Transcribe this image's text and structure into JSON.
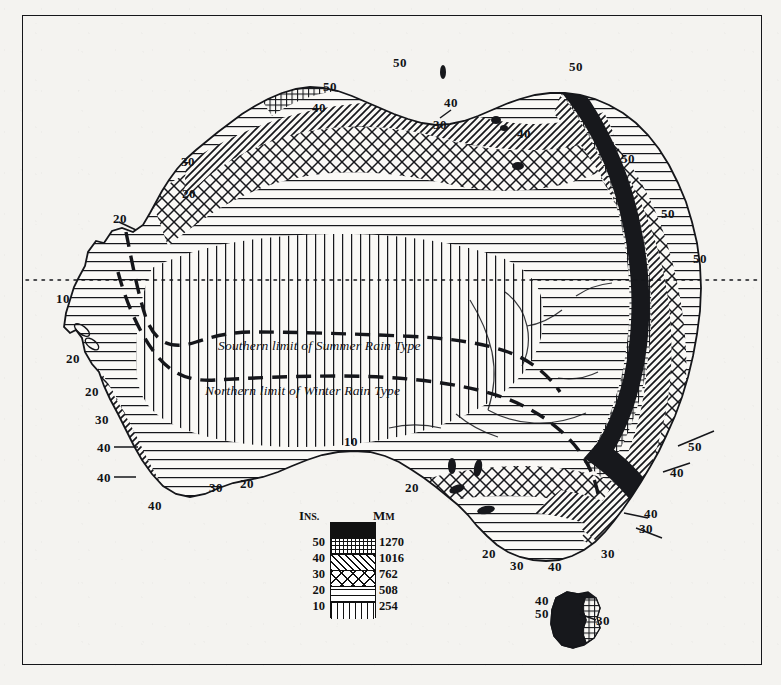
{
  "map": {
    "subject": "Australia",
    "theme": "Mean annual rainfall",
    "frame": {
      "x": 22,
      "y": 15,
      "width": 740,
      "height": 650
    },
    "reference_lines": [
      {
        "name": "tropic-of-capricorn",
        "style": "fine-dotted",
        "label": ""
      }
    ],
    "annotations": [
      {
        "id": "summer-rain-limit",
        "text": "Southern limit of Summer Rain Type",
        "x": 218,
        "y": 346,
        "style": "italic"
      },
      {
        "id": "winter-rain-limit",
        "text": "Northern limit of Winter Rain Type",
        "x": 205,
        "y": 391,
        "style": "italic"
      }
    ],
    "isohyet_labels": [
      {
        "value": "50",
        "x": 400,
        "y": 62
      },
      {
        "value": "50",
        "x": 330,
        "y": 86
      },
      {
        "value": "40",
        "x": 319,
        "y": 107
      },
      {
        "value": "40",
        "x": 451,
        "y": 102
      },
      {
        "value": "30",
        "x": 440,
        "y": 124
      },
      {
        "value": "40",
        "x": 524,
        "y": 133
      },
      {
        "value": "50",
        "x": 576,
        "y": 66
      },
      {
        "value": "50",
        "x": 628,
        "y": 158
      },
      {
        "value": "50",
        "x": 668,
        "y": 213
      },
      {
        "value": "50",
        "x": 700,
        "y": 258
      },
      {
        "value": "30",
        "x": 188,
        "y": 161
      },
      {
        "value": "20",
        "x": 189,
        "y": 193
      },
      {
        "value": "20",
        "x": 120,
        "y": 218
      },
      {
        "value": "10",
        "x": 63,
        "y": 298
      },
      {
        "value": "20",
        "x": 73,
        "y": 358
      },
      {
        "value": "20",
        "x": 92,
        "y": 391
      },
      {
        "value": "30",
        "x": 102,
        "y": 419
      },
      {
        "value": "40",
        "x": 104,
        "y": 447
      },
      {
        "value": "40",
        "x": 104,
        "y": 477
      },
      {
        "value": "40",
        "x": 155,
        "y": 505
      },
      {
        "value": "30",
        "x": 216,
        "y": 487
      },
      {
        "value": "20",
        "x": 247,
        "y": 483
      },
      {
        "value": "10",
        "x": 351,
        "y": 441
      },
      {
        "value": "20",
        "x": 412,
        "y": 487
      },
      {
        "value": "20",
        "x": 489,
        "y": 553
      },
      {
        "value": "30",
        "x": 517,
        "y": 565
      },
      {
        "value": "40",
        "x": 555,
        "y": 566
      },
      {
        "value": "30",
        "x": 608,
        "y": 553
      },
      {
        "value": "30",
        "x": 646,
        "y": 528
      },
      {
        "value": "40",
        "x": 651,
        "y": 513
      },
      {
        "value": "40",
        "x": 677,
        "y": 472
      },
      {
        "value": "50",
        "x": 695,
        "y": 446
      },
      {
        "value": "40",
        "x": 542,
        "y": 600
      },
      {
        "value": "50",
        "x": 542,
        "y": 613
      },
      {
        "value": "30",
        "x": 603,
        "y": 620
      }
    ]
  },
  "legend": {
    "name": "rainfall-legend",
    "header_left": "I",
    "header_left_small": "NS.",
    "header_right": "M",
    "header_right_small": "M",
    "bands": [
      {
        "pattern": "solid-black",
        "ins": "",
        "mm": ""
      },
      {
        "pattern": "fine-grid",
        "ins": "50",
        "mm": "1270"
      },
      {
        "pattern": "diagonal-hatch",
        "ins": "40",
        "mm": "1016"
      },
      {
        "pattern": "cross-hatch",
        "ins": "30",
        "mm": "762"
      },
      {
        "pattern": "horizontal-lines",
        "ins": "20",
        "mm": "508"
      },
      {
        "pattern": "vertical-lines",
        "ins": "10",
        "mm": "254"
      }
    ]
  },
  "chart_data": {
    "type": "map",
    "units_primary": "inches",
    "units_secondary": "millimetres",
    "categories": [
      "over 50",
      "40-50",
      "30-40",
      "20-30",
      "10-20",
      "under 10"
    ],
    "class_breaks_inches": [
      50,
      40,
      30,
      20,
      10
    ],
    "class_breaks_mm": [
      1270,
      1016,
      762,
      508,
      254
    ],
    "patterns": [
      "solid-black",
      "fine-grid",
      "diagonal-hatch",
      "cross-hatch",
      "horizontal-lines",
      "vertical-lines"
    ],
    "annotations": [
      "Southern limit of Summer Rain Type",
      "Northern limit of Winter Rain Type"
    ],
    "reference_line": "Tropic of Capricorn (dotted)"
  }
}
